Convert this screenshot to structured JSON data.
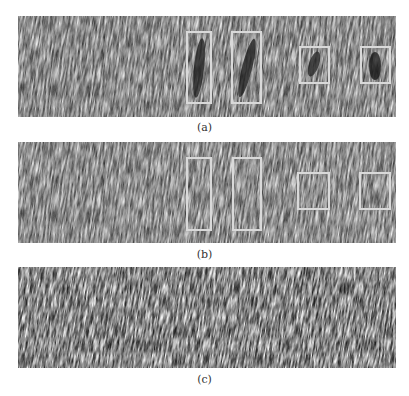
{
  "figure": {
    "panels": [
      {
        "id": "a",
        "caption": "(a)",
        "top": 16,
        "seed": 3,
        "dark_regions": true,
        "boxes": [
          {
            "left": 168,
            "top": 15,
            "width": 26,
            "height": 73
          },
          {
            "left": 213,
            "top": 15,
            "width": 31,
            "height": 73
          },
          {
            "left": 281,
            "top": 30,
            "width": 31,
            "height": 38
          },
          {
            "left": 342,
            "top": 30,
            "width": 31,
            "height": 38
          }
        ]
      },
      {
        "id": "b",
        "caption": "(b)",
        "top": 142,
        "seed": 3,
        "dark_regions": false,
        "boxes": [
          {
            "left": 168,
            "top": 15,
            "width": 26,
            "height": 74
          },
          {
            "left": 214,
            "top": 15,
            "width": 30,
            "height": 74
          },
          {
            "left": 279,
            "top": 30,
            "width": 33,
            "height": 38
          },
          {
            "left": 341,
            "top": 30,
            "width": 32,
            "height": 38
          }
        ]
      },
      {
        "id": "c",
        "caption": "(c)",
        "top": 267,
        "seed": 11,
        "dark_regions": false,
        "boxes": []
      }
    ],
    "captions": {
      "a": "(a)",
      "b": "(b)",
      "c": "(c)"
    },
    "caption_tops": {
      "a": 122,
      "b": 249,
      "c": 374
    },
    "colors": {
      "box_stroke": "#d9d9d9",
      "texture_base": "#6a6a6a",
      "caption_text": "#333333"
    }
  }
}
